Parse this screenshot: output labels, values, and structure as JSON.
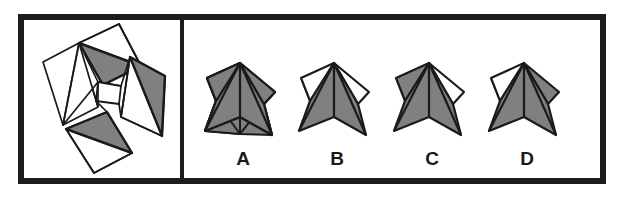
{
  "figure": {
    "kind": "spatial-reasoning-paper-folding-item",
    "frame": {
      "stroke_color": "#1c1c1c",
      "fill_color": "#ffffff",
      "border_thickness_px": 6,
      "x": 18,
      "y": 14,
      "width": 588,
      "height": 170
    },
    "divider": {
      "x": 182,
      "y_top": 17,
      "y_bottom": 181,
      "thickness_px": 4,
      "color": "#1c1c1c"
    },
    "colors": {
      "shaded_face": "#808080",
      "unshaded_face": "#ffffff",
      "outline": "#1a1a1a",
      "label_text": "#1a1a1a"
    }
  },
  "left_panel": {
    "name": "unfolded-net",
    "description": "Flat net: four squares arranged pinwheel-style around a small central opening, each square split by a diagonal fold line; one half of each square is shaded gray and the other half is white.",
    "net_pieces": [
      {
        "id": "piece-top",
        "square": [
          [
            78,
            42
          ],
          [
            117,
            24
          ],
          [
            140,
            66
          ],
          [
            101,
            84
          ]
        ],
        "fold_line": [
          [
            78,
            42
          ],
          [
            140,
            66
          ]
        ],
        "shaded_half": [
          [
            78,
            42
          ],
          [
            140,
            66
          ],
          [
            101,
            84
          ]
        ],
        "white_half": [
          [
            78,
            42
          ],
          [
            117,
            24
          ],
          [
            140,
            66
          ]
        ]
      },
      {
        "id": "piece-left",
        "square": [
          [
            43,
            62
          ],
          [
            78,
            42
          ],
          [
            98,
            106
          ],
          [
            62,
            124
          ]
        ],
        "fold_line": [
          [
            78,
            42
          ],
          [
            98,
            106
          ]
        ],
        "shaded_half": [
          [
            78,
            42
          ],
          [
            98,
            106
          ],
          [
            62,
            124
          ]
        ],
        "white_half": [
          [
            43,
            62
          ],
          [
            78,
            42
          ],
          [
            98,
            106
          ],
          [
            62,
            124
          ]
        ]
      },
      {
        "id": "piece-right",
        "square": [
          [
            129,
            57
          ],
          [
            163,
            76
          ],
          [
            161,
            136
          ],
          [
            122,
            117
          ]
        ],
        "fold_line": [
          [
            129,
            57
          ],
          [
            161,
            136
          ]
        ],
        "shaded_half": [
          [
            129,
            57
          ],
          [
            163,
            76
          ],
          [
            161,
            136
          ]
        ],
        "white_half": [
          [
            129,
            57
          ],
          [
            161,
            136
          ],
          [
            122,
            117
          ]
        ]
      },
      {
        "id": "piece-bottom",
        "square": [
          [
            66,
            128
          ],
          [
            106,
            112
          ],
          [
            131,
            152
          ],
          [
            93,
            172
          ]
        ],
        "fold_line": [
          [
            66,
            128
          ],
          [
            131,
            152
          ]
        ],
        "shaded_half": [
          [
            66,
            128
          ],
          [
            106,
            112
          ],
          [
            131,
            152
          ]
        ],
        "white_half": [
          [
            66,
            128
          ],
          [
            131,
            152
          ],
          [
            93,
            172
          ]
        ]
      }
    ],
    "center_hub": [
      [
        98,
        80
      ],
      [
        120,
        85
      ],
      [
        118,
        104
      ],
      [
        95,
        100
      ]
    ]
  },
  "right_panel": {
    "name": "answer-options",
    "options": [
      {
        "id": "option-a",
        "label": "A",
        "label_x": 243,
        "label_y": 165,
        "center_x": 240,
        "description": "Folded star form with all five visible facets shaded gray.",
        "shaded_facet_count": 5,
        "white_facet_count": 0
      },
      {
        "id": "option-b",
        "label": "B",
        "label_x": 337,
        "label_y": 165,
        "center_x": 334,
        "description": "Folded star form with the upper-left and upper-right facets white, the rest gray.",
        "shaded_facet_count": 3,
        "white_facet_count": 2
      },
      {
        "id": "option-c",
        "label": "C",
        "label_x": 432,
        "label_y": 165,
        "center_x": 429,
        "description": "Folded star form with only the upper-right facet white, the rest gray.",
        "shaded_facet_count": 4,
        "white_facet_count": 1
      },
      {
        "id": "option-d",
        "label": "D",
        "label_x": 527,
        "label_y": 165,
        "center_x": 524,
        "description": "Folded star form with only the upper-left facet white, the rest gray.",
        "shaded_facet_count": 4,
        "white_facet_count": 1
      }
    ]
  }
}
